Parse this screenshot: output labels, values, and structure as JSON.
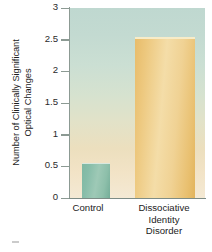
{
  "chart_data": {
    "type": "bar",
    "title": "",
    "subtitle": "",
    "xlabel": "",
    "ylabel_line1": "Number of Clinically Significant",
    "ylabel_line2": "Optical Changes",
    "categories": [
      "Control",
      "Dissociative Identity Disorder"
    ],
    "category_lines": [
      [
        "Control"
      ],
      [
        "Dissociative",
        "Identity",
        "Disorder"
      ]
    ],
    "values": [
      0.55,
      2.55
    ],
    "ylim": [
      0,
      3
    ],
    "yticks": [
      0,
      0.5,
      1,
      1.5,
      2,
      2.5,
      3
    ],
    "ytick_labels": [
      "0",
      "0.5",
      "1",
      "1.5",
      "2",
      "2.5",
      "3"
    ],
    "grid": false,
    "legend": "none",
    "colors": {
      "control_bar": "#8dbfaa",
      "did_bar": "#edc87e",
      "plot_background_top": "#bfd8d0",
      "plot_background_bottom": "#f4e9d4",
      "axis_line": "#8c9a93",
      "text": "#1c1c1c"
    }
  }
}
